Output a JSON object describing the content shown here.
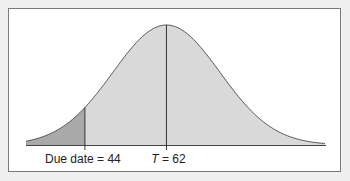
{
  "chart_data": {
    "type": "area",
    "title": "",
    "distribution": {
      "mean": 62,
      "sd_estimate": 11.8
    },
    "x_range_estimate": [
      31,
      97
    ],
    "markers": [
      {
        "name": "due_date",
        "value": 44,
        "label": "Due date = 44"
      },
      {
        "name": "mean",
        "value": 62,
        "label_var": "T",
        "label_rest": " = 62"
      }
    ],
    "shaded_region": {
      "from": "left tail",
      "to": 44
    },
    "xlabel": "",
    "ylabel": "",
    "grid": false,
    "colors": {
      "curve_fill": "#d9d9d9",
      "tail_fill": "#a9a9a9",
      "line": "#333333",
      "frame_bg": "#ffffff",
      "page_bg": "#efefef"
    }
  }
}
